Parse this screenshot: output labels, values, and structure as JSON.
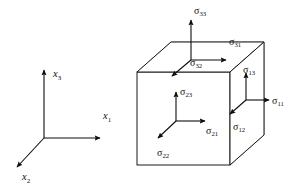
{
  "figure": {
    "background_color": "#ffffff",
    "line_color": "#1a1a1a",
    "hidden_edge_color": "#8c8c8c",
    "label_color": "#111111"
  },
  "axes": {
    "name": "coordinate-triad",
    "origin": {
      "x": 44,
      "y": 138
    },
    "items": [
      {
        "id": "x1",
        "symbol": "x",
        "subscript": "1",
        "direction": "right",
        "label_x": 107,
        "label_y": 117,
        "tip_x": 103,
        "tip_y": 138
      },
      {
        "id": "x2",
        "symbol": "x",
        "subscript": "2",
        "direction": "down-left",
        "label_x": 24,
        "label_y": 177,
        "tip_x": 13,
        "tip_y": 170
      },
      {
        "id": "x3",
        "symbol": "x",
        "subscript": "3",
        "direction": "up",
        "label_x": 53,
        "label_y": 77,
        "tip_x": 44,
        "tip_y": 68
      }
    ]
  },
  "cube": {
    "name": "stress-cube",
    "front_face": {
      "left": 137,
      "top": 72,
      "right": 230,
      "bottom": 165
    },
    "depth_offset": {
      "dx": 34,
      "dy": -30
    },
    "faces": [
      {
        "id": "top-face",
        "normal_axis": "x3",
        "components": [
          {
            "id": "sigma-33",
            "symbol": "σ",
            "subscript": "33",
            "type": "normal",
            "direction": "up",
            "label_x": 196,
            "label_y": 13
          },
          {
            "id": "sigma-31",
            "symbol": "σ",
            "subscript": "31",
            "type": "shear",
            "direction": "right",
            "label_x": 231,
            "label_y": 42
          },
          {
            "id": "sigma-32",
            "symbol": "σ",
            "subscript": "32",
            "type": "shear",
            "direction": "down-left",
            "label_x": 194,
            "label_y": 63
          }
        ]
      },
      {
        "id": "front-face",
        "normal_axis": "x2",
        "components": [
          {
            "id": "sigma-23",
            "symbol": "σ",
            "subscript": "23",
            "type": "shear",
            "direction": "up",
            "label_x": 186,
            "label_y": 93
          },
          {
            "id": "sigma-21",
            "symbol": "σ",
            "subscript": "21",
            "type": "shear",
            "direction": "right",
            "label_x": 209,
            "label_y": 131
          },
          {
            "id": "sigma-22",
            "symbol": "σ",
            "subscript": "22",
            "type": "normal",
            "direction": "down-left",
            "label_x": 161,
            "label_y": 154
          }
        ]
      },
      {
        "id": "right-face",
        "normal_axis": "x1",
        "components": [
          {
            "id": "sigma-13",
            "symbol": "σ",
            "subscript": "13",
            "type": "shear",
            "direction": "up",
            "label_x": 246,
            "label_y": 70
          },
          {
            "id": "sigma-11",
            "symbol": "σ",
            "subscript": "11",
            "type": "normal",
            "direction": "right",
            "label_x": 272,
            "label_y": 104
          },
          {
            "id": "sigma-12",
            "symbol": "σ",
            "subscript": "12",
            "type": "shear",
            "direction": "down-left",
            "label_x": 236,
            "label_y": 127
          }
        ]
      }
    ]
  }
}
